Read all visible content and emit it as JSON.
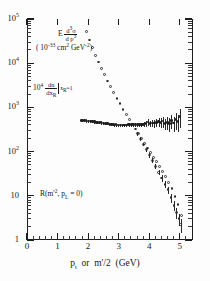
{
  "chart_data": {
    "type": "scatter",
    "title": "",
    "xlabel": "p_t or m'/2 (GeV)",
    "ylabel": "",
    "xlim": [
      0,
      5.4
    ],
    "ylim_log": [
      1,
      100000
    ],
    "x_ticks": [
      0,
      1,
      2,
      3,
      4,
      5
    ],
    "x_tick_labels": [
      "0",
      "1",
      "2",
      "3",
      "4",
      "5"
    ],
    "y_ticks": [
      1,
      10,
      100,
      1000,
      10000,
      100000
    ],
    "y_tick_labels": [
      "1",
      "10",
      "10",
      "10",
      "10",
      "10"
    ],
    "y_tick_exponents": [
      "",
      "",
      "2",
      "3",
      "4",
      "5"
    ],
    "grid": false,
    "legend": "none",
    "series": [
      {
        "name": "E d3sigma/dp3 (invariant cross section)",
        "marker": "open-circle",
        "x": [
          1.95,
          2.05,
          2.15,
          2.25,
          2.35,
          2.45,
          2.55,
          2.65,
          2.75,
          2.85,
          2.95,
          3.05,
          3.15,
          3.25,
          3.35,
          3.45,
          3.55,
          3.65,
          3.75,
          3.85,
          3.95,
          4.05,
          4.15,
          4.25,
          4.35,
          4.45,
          4.55,
          4.65,
          4.75,
          4.85,
          4.95,
          5.05
        ],
        "y": [
          52000,
          33000,
          22000,
          15000,
          10500,
          7600,
          5400,
          3900,
          2900,
          2150,
          1600,
          1200,
          900,
          690,
          530,
          410,
          320,
          250,
          195,
          152,
          120,
          95,
          74,
          58,
          45,
          35,
          27,
          20,
          14.5,
          9.5,
          6.2,
          3.6
        ],
        "yerr_rel": [
          0,
          0,
          0,
          0,
          0,
          0,
          0,
          0,
          0,
          0,
          0,
          0,
          0,
          0,
          0,
          0,
          0,
          0,
          0,
          0,
          0,
          0,
          0,
          0,
          0,
          0,
          0,
          0,
          0,
          0,
          0,
          0
        ]
      },
      {
        "name": "10^4 dn/dx_R at x_R=1 (ratio R)",
        "marker": "filled-circle-errorbar",
        "x": [
          1.8,
          1.87,
          1.94,
          2.01,
          2.08,
          2.15,
          2.22,
          2.29,
          2.36,
          2.43,
          2.5,
          2.57,
          2.64,
          2.71,
          2.78,
          2.85,
          2.92,
          2.99,
          3.06,
          3.13,
          3.2,
          3.27,
          3.34,
          3.41,
          3.48,
          3.55,
          3.62,
          3.69,
          3.76,
          3.83,
          3.9,
          3.97,
          4.04,
          4.11,
          4.18,
          4.25,
          4.32,
          4.39,
          4.46,
          4.53,
          4.6,
          4.67,
          4.74,
          4.81,
          4.88,
          4.95,
          5.02
        ],
        "y": [
          500,
          495,
          490,
          485,
          480,
          470,
          465,
          455,
          450,
          445,
          440,
          430,
          425,
          415,
          410,
          400,
          398,
          395,
          392,
          390,
          392,
          395,
          400,
          405,
          400,
          398,
          402,
          405,
          400,
          410,
          420,
          460,
          430,
          440,
          435,
          450,
          470,
          455,
          480,
          430,
          450,
          420,
          500,
          440,
          520,
          470,
          620
        ],
        "yerr_rel": [
          0.08,
          0.08,
          0.08,
          0.08,
          0.08,
          0.08,
          0.08,
          0.08,
          0.08,
          0.08,
          0.08,
          0.08,
          0.08,
          0.08,
          0.08,
          0.08,
          0.08,
          0.08,
          0.08,
          0.09,
          0.09,
          0.09,
          0.09,
          0.09,
          0.09,
          0.1,
          0.1,
          0.11,
          0.12,
          0.13,
          0.15,
          0.17,
          0.17,
          0.18,
          0.2,
          0.22,
          0.24,
          0.26,
          0.28,
          0.3,
          0.32,
          0.34,
          0.36,
          0.38,
          0.4,
          0.42,
          0.45
        ]
      },
      {
        "name": "R low-tail (open circles with errors)",
        "marker": "open-circle-errorbar",
        "x": [
          3.62,
          3.72,
          3.82,
          3.92,
          4.02,
          4.12,
          4.22,
          4.32,
          4.42,
          4.52,
          4.62,
          4.72,
          4.82,
          4.9,
          4.98,
          5.04
        ],
        "y": [
          250,
          190,
          145,
          110,
          83,
          62,
          46,
          34,
          25,
          18,
          13.5,
          9.0,
          6.0,
          4.2,
          3.0,
          2.2
        ],
        "yerr_rel": [
          0.1,
          0.1,
          0.1,
          0.11,
          0.12,
          0.13,
          0.14,
          0.15,
          0.16,
          0.18,
          0.2,
          0.22,
          0.25,
          0.28,
          0.3,
          0.33
        ]
      }
    ],
    "annotations": [
      {
        "id": "invariant-cross-section",
        "text": "E d3σ/dp3"
      },
      {
        "id": "cross-section-units",
        "text": "(10-33 cm2 GeV-2)"
      },
      {
        "id": "dn-dx-label",
        "text": "104 dn/dxR |xR=1"
      },
      {
        "id": "ratio-label",
        "text": "R(m'2, pL = 0)"
      }
    ]
  },
  "axis": {
    "x_title_main": "p",
    "x_title_sub": "t",
    "x_title_or": " or  m",
    "x_title_prime": "'",
    "x_title_rest": "/2  (GeV)",
    "y_labels": [
      {
        "mantissa": "10",
        "exponent": "5"
      },
      {
        "mantissa": "10",
        "exponent": "4"
      },
      {
        "mantissa": "10",
        "exponent": "3"
      },
      {
        "mantissa": "10",
        "exponent": "2"
      },
      {
        "mantissa": "10",
        "exponent": ""
      },
      {
        "mantissa": "1",
        "exponent": ""
      }
    ],
    "x_labels": [
      "0",
      "1",
      "2",
      "3",
      "4",
      "5"
    ]
  },
  "annotations": {
    "cross_section": {
      "prefix": "E",
      "num": "d3σ",
      "den": "d p3",
      "units": "( 10-33 cm2 GeV-2)"
    },
    "dn_dx": {
      "prefix": "10",
      "prefix_exp": "4",
      "num": "dn",
      "den": "dxR",
      "condition": "xR = 1"
    },
    "ratio": {
      "text": "R(m'2, pL = 0)"
    }
  }
}
